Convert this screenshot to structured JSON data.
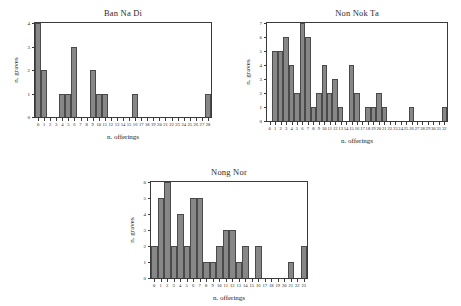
{
  "figure": {
    "background": "#ffffff",
    "bar_color": "#878787",
    "bar_edge_color": "#4a4a4a",
    "axis_color": "#3a3a3a"
  },
  "chart_data": [
    {
      "type": "bar",
      "title": "Ban Na Di",
      "xlabel": "n. offerings",
      "ylabel": "n. graves",
      "xlim": [
        0,
        28
      ],
      "ylim": [
        0,
        4
      ],
      "grid": false,
      "legend": "none",
      "xticks": [
        "0",
        "1",
        "2",
        "3",
        "4",
        "5",
        "6",
        "7",
        "8",
        "9",
        "10",
        "11",
        "12",
        "13",
        "14",
        "15",
        "16",
        "17",
        "18",
        "19",
        "20",
        "21",
        "22",
        "23",
        "24",
        "25",
        "26",
        "27",
        "28"
      ],
      "yticks": [
        "0",
        "1",
        "2",
        "3",
        "4"
      ],
      "categories": [
        0,
        1,
        2,
        3,
        4,
        5,
        6,
        7,
        8,
        9,
        10,
        11,
        12,
        13,
        14,
        15,
        16,
        17,
        18,
        19,
        20,
        21,
        22,
        23,
        24,
        25,
        26,
        27,
        28
      ],
      "values": [
        4,
        2,
        0,
        0,
        1,
        1,
        3,
        0,
        0,
        2,
        1,
        1,
        0,
        0,
        0,
        0,
        1,
        0,
        0,
        0,
        0,
        0,
        0,
        0,
        0,
        0,
        0,
        0,
        1
      ]
    },
    {
      "type": "bar",
      "title": "Non Nok Ta",
      "xlabel": "n. offerings",
      "ylabel": "n. graves",
      "xlim": [
        0,
        32
      ],
      "ylim": [
        0,
        7
      ],
      "grid": false,
      "legend": "none",
      "xticks": [
        "0",
        "1",
        "2",
        "3",
        "4",
        "5",
        "6",
        "7",
        "8",
        "9",
        "10",
        "11",
        "12",
        "13",
        "14",
        "15",
        "16",
        "17",
        "18",
        "19",
        "20",
        "21",
        "22",
        "23",
        "24",
        "25",
        "26",
        "27",
        "28",
        "29",
        "30",
        "31",
        "32"
      ],
      "yticks": [
        "0",
        "1",
        "2",
        "3",
        "4",
        "5",
        "6",
        "7"
      ],
      "categories": [
        0,
        1,
        2,
        3,
        4,
        5,
        6,
        7,
        8,
        9,
        10,
        11,
        12,
        13,
        14,
        15,
        16,
        17,
        18,
        19,
        20,
        21,
        22,
        23,
        24,
        25,
        26,
        27,
        28,
        29,
        30,
        31,
        32
      ],
      "values": [
        0,
        5,
        5,
        6,
        4,
        2,
        7,
        6,
        1,
        2,
        4,
        2,
        3,
        1,
        0,
        4,
        2,
        0,
        1,
        1,
        2,
        1,
        0,
        0,
        0,
        0,
        1,
        0,
        0,
        0,
        0,
        0,
        1
      ]
    },
    {
      "type": "bar",
      "title": "Nong Nor",
      "xlabel": "n. offerings",
      "ylabel": "n. graves",
      "xlim": [
        0,
        23
      ],
      "ylim": [
        0,
        6
      ],
      "grid": false,
      "legend": "none",
      "xticks": [
        "0",
        "1",
        "2",
        "3",
        "4",
        "5",
        "6",
        "7",
        "8",
        "9",
        "10",
        "11",
        "12",
        "13",
        "14",
        "15",
        "16",
        "17",
        "18",
        "19",
        "20",
        "21",
        "22",
        "23"
      ],
      "yticks": [
        "0",
        "1",
        "2",
        "3",
        "4",
        "5",
        "6"
      ],
      "categories": [
        0,
        1,
        2,
        3,
        4,
        5,
        6,
        7,
        8,
        9,
        10,
        11,
        12,
        13,
        14,
        15,
        16,
        17,
        18,
        19,
        20,
        21,
        22,
        23
      ],
      "values": [
        2,
        5,
        6,
        2,
        4,
        2,
        5,
        5,
        1,
        1,
        2,
        3,
        3,
        1,
        2,
        0,
        2,
        0,
        0,
        0,
        0,
        1,
        0,
        2
      ]
    }
  ]
}
